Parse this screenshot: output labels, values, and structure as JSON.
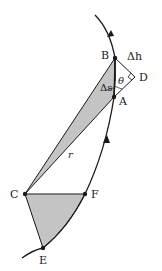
{
  "diagram": {
    "colors": {
      "stroke": "#1a1a1a",
      "fill": "#c4c4c4",
      "background": "#ffffff"
    },
    "points": {
      "A": {
        "label": "A",
        "x": 114,
        "y": 97
      },
      "B": {
        "label": "B",
        "x": 115,
        "y": 58
      },
      "C": {
        "label": "C",
        "x": 25,
        "y": 194
      },
      "D": {
        "label": "D",
        "x": 135,
        "y": 77
      },
      "E": {
        "label": "E",
        "x": 43,
        "y": 248
      },
      "F": {
        "label": "F",
        "x": 85,
        "y": 194
      }
    },
    "labels": {
      "delta_h": "Δh",
      "delta_s": "Δs",
      "theta": "θ",
      "r": "r",
      "A": "A",
      "B": "B",
      "C": "C",
      "D": "D",
      "E": "E",
      "F": "F"
    }
  }
}
